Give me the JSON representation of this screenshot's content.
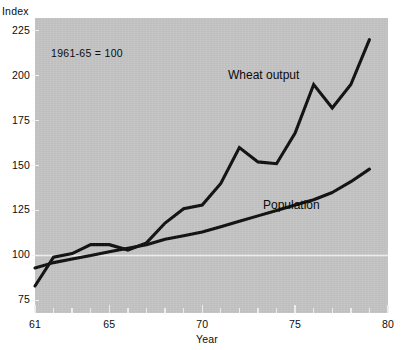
{
  "chart_data": {
    "type": "line",
    "title": "",
    "xlabel": "Year",
    "ylabel": "Index",
    "note": "1961-65  =  100",
    "xlim": [
      61,
      80
    ],
    "ylim": [
      68,
      232
    ],
    "yticks": [
      75,
      100,
      125,
      150,
      175,
      200,
      225
    ],
    "ytick_labels": [
      "75",
      "100",
      "125",
      "150",
      "175",
      "200",
      "225"
    ],
    "xticks": [
      61,
      62,
      63,
      64,
      65,
      66,
      67,
      68,
      69,
      70,
      71,
      72,
      73,
      74,
      75,
      76,
      77,
      78,
      79,
      80
    ],
    "xtick_labels_shown": [
      "61",
      "65",
      "70",
      "75",
      "80"
    ],
    "xtick_labels_values": [
      61,
      65,
      70,
      75,
      80
    ],
    "grid": false,
    "reference_line": {
      "value": 100,
      "color": "#f2f2f2"
    },
    "legend_position": "inline-annotations",
    "background_color": "#c4c4c4",
    "line_color": "#101010",
    "x": [
      61,
      62,
      63,
      64,
      65,
      66,
      67,
      68,
      69,
      70,
      71,
      72,
      73,
      74,
      75,
      76,
      77,
      78,
      79
    ],
    "series": [
      {
        "name": "Wheat output",
        "label": "Wheat output",
        "values": [
          83,
          99,
          101,
          106,
          106,
          103,
          107,
          118,
          126,
          128,
          140,
          160,
          152,
          151,
          168,
          195,
          182,
          195,
          220
        ]
      },
      {
        "name": "Population",
        "label": "Population",
        "values": [
          93,
          96,
          98,
          100,
          102,
          104,
          106,
          109,
          111,
          113,
          116,
          119,
          122,
          125,
          128,
          131,
          135,
          141,
          148
        ]
      }
    ]
  },
  "labels": {
    "y_axis_title": "Index",
    "x_axis_title": "Year",
    "note": "1961-65  =  100",
    "wheat_label": "Wheat output",
    "population_label": "Population"
  }
}
